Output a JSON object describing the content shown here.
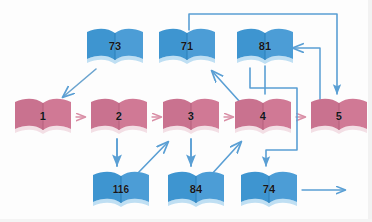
{
  "diagram": {
    "colors": {
      "blue_book": "#3e95d0",
      "blue_book_light": "#63aede",
      "blue_book_shadow": "#bfdff3",
      "pink_book": "#c9728f",
      "pink_book_light": "#d68aa2",
      "pink_book_shadow": "#f3dfe5",
      "arrow_blue": "#5a9fd4",
      "arrow_pink": "#d98fa6",
      "label_text": "#14161a",
      "background": "#fdfdfd"
    },
    "nodes": [
      {
        "id": "n1",
        "label": "1",
        "color": "pink",
        "x": 12,
        "y": 95
      },
      {
        "id": "n2",
        "label": "2",
        "color": "pink",
        "x": 88,
        "y": 95
      },
      {
        "id": "n3",
        "label": "3",
        "color": "pink",
        "x": 160,
        "y": 95
      },
      {
        "id": "n4",
        "label": "4",
        "color": "pink",
        "x": 232,
        "y": 95
      },
      {
        "id": "n5",
        "label": "5",
        "color": "pink",
        "x": 308,
        "y": 95
      },
      {
        "id": "n73",
        "label": "73",
        "color": "blue",
        "x": 84,
        "y": 25
      },
      {
        "id": "n71",
        "label": "71",
        "color": "blue",
        "x": 156,
        "y": 25
      },
      {
        "id": "n81",
        "label": "81",
        "color": "blue",
        "x": 234,
        "y": 25
      },
      {
        "id": "n116",
        "label": "116",
        "color": "blue",
        "x": 90,
        "y": 168
      },
      {
        "id": "n84",
        "label": "84",
        "color": "blue",
        "x": 165,
        "y": 168
      },
      {
        "id": "n74",
        "label": "74",
        "color": "blue",
        "x": 238,
        "y": 168
      }
    ],
    "edges": [
      {
        "name": "edge-73-to-1",
        "from": "73",
        "to": "1",
        "style": "diagonal",
        "color": "blue"
      },
      {
        "name": "edge-1-to-2",
        "from": "1",
        "to": "2",
        "style": "straight",
        "color": "pink"
      },
      {
        "name": "edge-2-to-3",
        "from": "2",
        "to": "3",
        "style": "straight",
        "color": "pink"
      },
      {
        "name": "edge-3-to-4",
        "from": "3",
        "to": "4",
        "style": "straight",
        "color": "pink"
      },
      {
        "name": "edge-4-to-5",
        "from": "4",
        "to": "5",
        "style": "straight",
        "color": "pink"
      },
      {
        "name": "edge-2-to-116",
        "from": "2",
        "to": "116",
        "style": "straight",
        "color": "blue"
      },
      {
        "name": "edge-116-to-3",
        "from": "116",
        "to": "3",
        "style": "diagonal",
        "color": "blue"
      },
      {
        "name": "edge-3-to-84",
        "from": "3",
        "to": "84",
        "style": "straight",
        "color": "blue"
      },
      {
        "name": "edge-84-to-4",
        "from": "84",
        "to": "4",
        "style": "diagonal",
        "color": "blue"
      },
      {
        "name": "edge-4-to-71",
        "from": "4",
        "to": "71",
        "style": "diagonal",
        "color": "blue"
      },
      {
        "name": "edge-71-to-5",
        "from": "71",
        "to": "5",
        "style": "orthogonal-top",
        "color": "blue"
      },
      {
        "name": "edge-81-to-74",
        "from": "81",
        "to": "74",
        "style": "orthogonal-right",
        "color": "blue"
      },
      {
        "name": "edge-5-to-81",
        "from": "5",
        "to": "81",
        "style": "orthogonal-return",
        "color": "blue"
      },
      {
        "name": "edge-74-out",
        "from": "74",
        "to": "",
        "style": "straight-out",
        "color": "blue"
      }
    ]
  }
}
